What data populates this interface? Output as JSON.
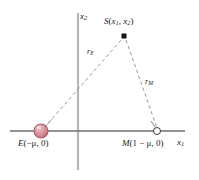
{
  "figure": {
    "type": "diagram",
    "background_color": "#ffffff"
  },
  "axes": {
    "horizontal": {
      "label_main": "x",
      "label_sub": "1",
      "color": "#6e6e6e",
      "y_position": 131,
      "x_start": 10,
      "x_end": 185
    },
    "vertical": {
      "label_main": "x",
      "label_sub": "2",
      "color": "#b0b0b0",
      "x_position": 78,
      "y_start": 13,
      "y_end": 170
    }
  },
  "points": [
    {
      "id": "earth",
      "label_name": "E",
      "label_coords": "(−μ, 0)",
      "marker": "filled-sphere",
      "color": "#d98b95",
      "edge_color": "#a85a66",
      "x": 41,
      "y": 131,
      "radius": 7
    },
    {
      "id": "satellite",
      "label_name": "S",
      "label_coords_open": "(",
      "label_coords_x1": "x",
      "label_coords_x1_sub": "1",
      "label_coords_comma": ", ",
      "label_coords_x2": "x",
      "label_coords_x2_sub": "2",
      "label_coords_close": ")",
      "marker": "filled-square",
      "color": "#1a1a1a",
      "x": 124,
      "y": 36,
      "size": 5
    },
    {
      "id": "moon",
      "label_name": "M",
      "label_coords": "(1 − μ, 0)",
      "marker": "open-circle",
      "color": "#ffffff",
      "edge_color": "#3a3a3a",
      "x": 157,
      "y": 131,
      "radius": 3.5
    }
  ],
  "distances": [
    {
      "id": "r-earth",
      "label_main": "r",
      "label_sub": "E",
      "from": "earth",
      "to": "satellite",
      "style": "dashed",
      "color": "#9a9a9a"
    },
    {
      "id": "r-moon",
      "label_main": "r",
      "label_sub": "M",
      "from": "satellite",
      "to": "moon",
      "style": "dashed",
      "color": "#9a9a9a"
    }
  ]
}
